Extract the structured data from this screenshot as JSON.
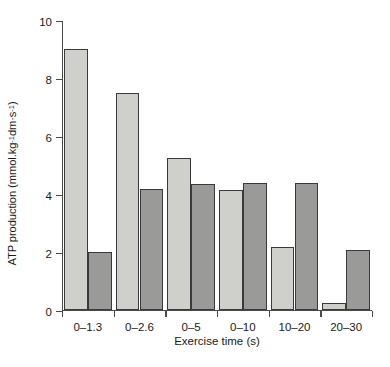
{
  "chart_data": {
    "type": "bar",
    "title": "",
    "xlabel": "Exercise time (s)",
    "ylabel_full": "ATP production (mmol.kg⁻¹ dm·s⁻¹)",
    "ylabel_parts": {
      "main": "ATP production (mmol.kg",
      "sup1": "-1",
      "mid": " dm·s",
      "sup2": "-1",
      "close": ")"
    },
    "categories": [
      "0–1.3",
      "0–2.6",
      "0–5",
      "0–10",
      "10–20",
      "20–30"
    ],
    "series": [
      {
        "name": "light-series",
        "color": "#cfcfcb",
        "values": [
          9.0,
          7.5,
          5.25,
          4.15,
          2.2,
          0.25
        ]
      },
      {
        "name": "dark-series",
        "color": "#9a9a98",
        "values": [
          2.0,
          4.2,
          4.35,
          4.4,
          4.4,
          2.1
        ]
      }
    ],
    "ylim": [
      0,
      10
    ],
    "yticks": [
      0,
      2,
      4,
      6,
      8,
      10
    ],
    "ytick_labels": [
      "0",
      "2",
      "4",
      "6",
      "8",
      "10"
    ],
    "grid": false,
    "legend": "none"
  }
}
